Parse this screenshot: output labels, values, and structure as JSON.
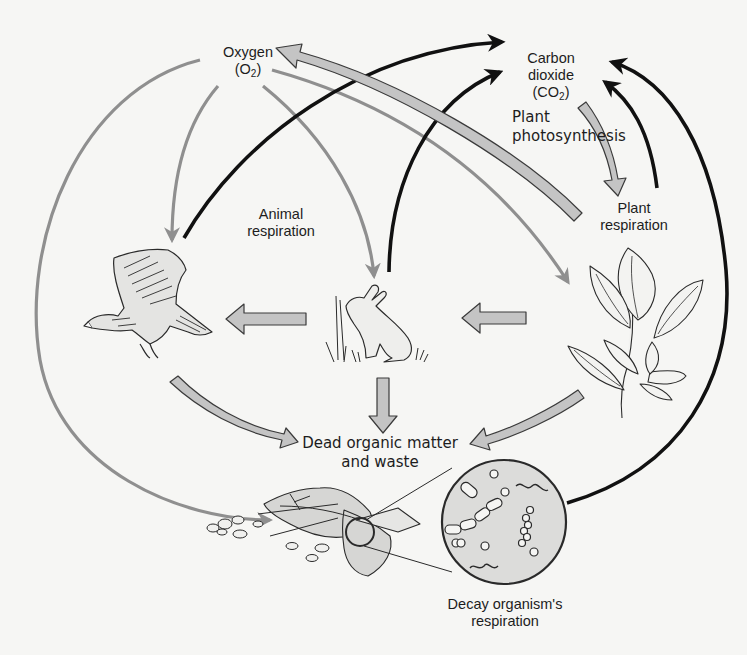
{
  "diagram": {
    "colors": {
      "background": "#f6f6f4",
      "oxygen_arrow": "#8f8f8f",
      "co2_arrow": "#111111",
      "matter_arrow_fill": "#c4c4c4",
      "matter_arrow_stroke": "#3a3a3a",
      "text": "#1d1d1d"
    },
    "nodes": {
      "oxygen": {
        "line1": "Oxygen",
        "line2_prefix": "(O",
        "line2_sub": "2",
        "line2_suffix": ")"
      },
      "carbon_dioxide": {
        "line1": "Carbon",
        "line2": "dioxide",
        "line3_prefix": "(CO",
        "line3_sub": "2",
        "line3_suffix": ")"
      },
      "plant_photosynthesis": {
        "line1": "Plant",
        "line2": "photosynthesis"
      },
      "plant_respiration": {
        "line1": "Plant",
        "line2": "respiration"
      },
      "animal_respiration": {
        "line1": "Animal",
        "line2": "respiration"
      },
      "dead_organic_matter": {
        "line1": "Dead organic matter",
        "line2": "and waste"
      },
      "decay_respiration": {
        "line1": "Decay organism's",
        "line2": "respiration"
      }
    },
    "illustrations": [
      {
        "name": "hawk",
        "description": "flying bird of prey"
      },
      {
        "name": "rabbit",
        "description": "rabbit sitting in grass"
      },
      {
        "name": "plant",
        "description": "leafy plant sprig"
      },
      {
        "name": "leaf-litter",
        "description": "decaying leaves and debris"
      },
      {
        "name": "microorganisms",
        "description": "magnified circle of bacteria"
      }
    ],
    "flows": [
      {
        "from": "oxygen",
        "to": "hawk",
        "type": "oxygen"
      },
      {
        "from": "oxygen",
        "to": "rabbit",
        "type": "oxygen"
      },
      {
        "from": "oxygen",
        "to": "plant",
        "type": "oxygen"
      },
      {
        "from": "oxygen",
        "to": "decay-organisms",
        "type": "oxygen"
      },
      {
        "from": "hawk",
        "to": "carbon_dioxide",
        "type": "co2"
      },
      {
        "from": "rabbit",
        "to": "carbon_dioxide",
        "type": "co2"
      },
      {
        "from": "plant",
        "to": "carbon_dioxide",
        "type": "co2"
      },
      {
        "from": "decay-organisms",
        "to": "carbon_dioxide",
        "type": "co2"
      },
      {
        "from": "plant",
        "to": "oxygen",
        "type": "photosynthesis"
      },
      {
        "from": "carbon_dioxide",
        "to": "plant",
        "type": "photosynthesis"
      },
      {
        "from": "plant",
        "to": "rabbit",
        "type": "food"
      },
      {
        "from": "rabbit",
        "to": "hawk",
        "type": "food"
      },
      {
        "from": "hawk",
        "to": "dead_organic_matter",
        "type": "matter"
      },
      {
        "from": "rabbit",
        "to": "dead_organic_matter",
        "type": "matter"
      },
      {
        "from": "plant",
        "to": "dead_organic_matter",
        "type": "matter"
      }
    ]
  }
}
